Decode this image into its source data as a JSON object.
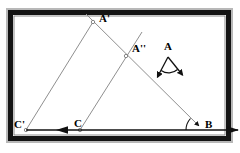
{
  "figure": {
    "type": "geometry-construction-diagram",
    "background_color": "#ffffff",
    "frame": {
      "name": "picture-frame-border",
      "outer_color": "#b8b8b8",
      "mid_color": "#111111",
      "inner_color": "#ffffff",
      "outer_rect": {
        "x": 7,
        "y": 9,
        "width": 225,
        "height": 133
      },
      "mid_rect": {
        "x": 9,
        "y": 11,
        "width": 221,
        "height": 129
      },
      "inner_rect": {
        "x": 14,
        "y": 16,
        "width": 211,
        "height": 119
      }
    },
    "line_color": "#8a8a8a",
    "heavy_line_color": "#111111",
    "label_color": "#000000",
    "points": [
      {
        "id": "A-prime",
        "label": "A'",
        "x": 93,
        "y": 22,
        "label_x": 99,
        "label_y": 15,
        "marked": true
      },
      {
        "id": "A-double",
        "label": "A''",
        "x": 126,
        "y": 56,
        "label_x": 132,
        "label_y": 45,
        "marked": true
      },
      {
        "id": "A",
        "label": "A",
        "x": 168,
        "y": 57,
        "label_x": 165,
        "label_y": 44,
        "marked": false
      },
      {
        "id": "C-prime",
        "label": "C'",
        "x": 26,
        "y": 130,
        "label_x": 15,
        "label_y": 122,
        "marked": true
      },
      {
        "id": "C",
        "label": "C",
        "x": 80,
        "y": 130,
        "label_x": 74,
        "label_y": 121,
        "marked": true
      },
      {
        "id": "B",
        "label": "B",
        "x": 203,
        "y": 130,
        "label_x": 205,
        "label_y": 121,
        "marked": false
      }
    ],
    "segments": [
      {
        "id": "segment-Cprime-Aprime",
        "from": "C'",
        "to": "A'",
        "x1": 26,
        "y1": 130,
        "x2": 93,
        "y2": 22,
        "style": "thin-gray"
      },
      {
        "id": "segment-C-Adouble-up",
        "from": "C",
        "to": "A''",
        "x1": 80,
        "y1": 130,
        "x2": 142,
        "y2": 32,
        "style": "thin-gray"
      },
      {
        "id": "ray-Aprime-to-B",
        "from": "A'",
        "to": "B",
        "x1": 86,
        "y1": 14,
        "x2": 203,
        "y2": 130,
        "style": "thin-gray-arrow"
      }
    ],
    "baseline": {
      "id": "baseline-ray-CB",
      "x1": 26,
      "y1": 130,
      "x2": 238,
      "y2": 130,
      "style": "heavy-black",
      "left_arrow_at_x": 62,
      "right_arrow_at_x": 238
    },
    "angle_marks": [
      {
        "id": "angle-at-B",
        "vertex": "B",
        "x": 203,
        "y": 130,
        "radius": 17,
        "start_deg": 180,
        "end_deg": 225
      }
    ],
    "angle_gadget_A": {
      "id": "angle-gadget-at-A",
      "vertex_x": 168,
      "vertex_y": 57,
      "left_tip_x": 156,
      "left_tip_y": 80,
      "right_tip_x": 184,
      "right_tip_y": 78,
      "arc_radius": 14,
      "arrowheads": "both-ends",
      "stroke": "#111111"
    },
    "caption": ""
  }
}
